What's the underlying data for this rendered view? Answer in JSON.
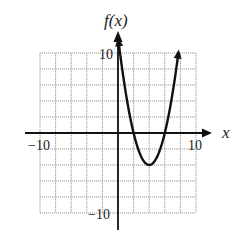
{
  "chart_data": {
    "type": "line",
    "title": "",
    "xlabel": "x",
    "ylabel": "f(x)",
    "xlim": [
      -10,
      10
    ],
    "ylim": [
      -10,
      10
    ],
    "grid": true,
    "grid_step": 2,
    "tick_labels": {
      "x": [
        "-10",
        "10"
      ],
      "y": [
        "10",
        "-10"
      ]
    },
    "series": [
      {
        "name": "f(x)",
        "equation": "f(x) = x^2 - 8x + 12",
        "vertex": [
          4,
          -4
        ],
        "x_intercepts": [
          2,
          6
        ],
        "x": [
          0.1,
          1,
          2,
          3,
          4,
          5,
          6,
          7,
          7.7
        ],
        "values": [
          11.21,
          5,
          0,
          -3,
          -4,
          -3,
          0,
          5,
          10.29
        ]
      }
    ],
    "legend": "none"
  },
  "labels": {
    "y_axis": "f(x)",
    "x_axis": "x",
    "x_min": "−10",
    "x_max": "10",
    "y_max": "10",
    "y_min": "−10"
  }
}
